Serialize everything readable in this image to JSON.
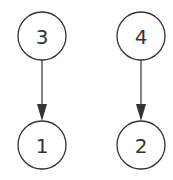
{
  "diagram": {
    "type": "directed-graph",
    "nodes": [
      {
        "id": "3",
        "label": "3",
        "cx": 42,
        "cy": 36
      },
      {
        "id": "4",
        "label": "4",
        "cx": 141,
        "cy": 36
      },
      {
        "id": "1",
        "label": "1",
        "cx": 42,
        "cy": 145
      },
      {
        "id": "2",
        "label": "2",
        "cx": 141,
        "cy": 145
      }
    ],
    "edges": [
      {
        "from": "3",
        "to": "1"
      },
      {
        "from": "4",
        "to": "2"
      }
    ],
    "colors": {
      "stroke": "#333333",
      "background": "#ffffff"
    }
  }
}
